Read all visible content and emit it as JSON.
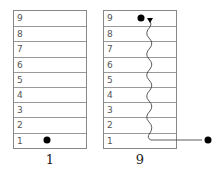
{
  "left_panel": {
    "levels": [
      "9",
      "8",
      "7",
      "6",
      "5",
      "4",
      "3",
      "2",
      "1"
    ],
    "caption": "1",
    "marker_level": "1"
  },
  "right_panel": {
    "levels": [
      "9",
      "8",
      "7",
      "6",
      "5",
      "4",
      "3",
      "2",
      "1"
    ],
    "caption": "9",
    "marker_level": "9"
  },
  "colors": {
    "border": "#888888",
    "text": "#555555",
    "marker": "#000000"
  }
}
